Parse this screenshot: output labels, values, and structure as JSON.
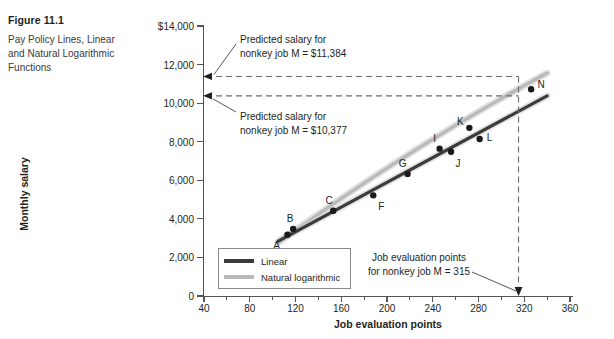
{
  "figure": {
    "number": "Figure 11.1",
    "title": "Pay Policy Lines, Linear and Natural Logarithmic Functions"
  },
  "chart_data": {
    "type": "scatter",
    "title": "Pay Policy Lines, Linear and Natural Logarithmic Functions",
    "xlabel": "Job evaluation points",
    "ylabel": "Monthly salary",
    "xlim": [
      40,
      360
    ],
    "ylim": [
      0,
      14000
    ],
    "xticks": [
      40,
      80,
      120,
      160,
      200,
      240,
      280,
      320,
      360
    ],
    "xtick_labels": [
      "40",
      "80",
      "120",
      "160",
      "200",
      "240",
      "280",
      "320",
      "360"
    ],
    "xminor_step": 20,
    "yticks": [
      0,
      2000,
      4000,
      6000,
      8000,
      10000,
      12000,
      14000
    ],
    "ytick_labels": [
      "0",
      "2,000",
      "4,000",
      "6,000",
      "8,000",
      "10,000",
      "12,000",
      "$14,000"
    ],
    "grid": false,
    "legend_position": "lower-left-inside",
    "points": [
      {
        "label": "A",
        "x": 113,
        "y": 3180,
        "label_dx": -11,
        "label_dy": 10
      },
      {
        "label": "B",
        "x": 118,
        "y": 3480,
        "label_dx": -3,
        "label_dy": -11
      },
      {
        "label": "C",
        "x": 153,
        "y": 4420,
        "label_dx": -4,
        "label_dy": -11
      },
      {
        "label": "F",
        "x": 188,
        "y": 5220,
        "label_dx": 8,
        "label_dy": 11
      },
      {
        "label": "G",
        "x": 218,
        "y": 6330,
        "label_dx": -5,
        "label_dy": -11
      },
      {
        "label": "I",
        "x": 246,
        "y": 7640,
        "label_dx": -5,
        "label_dy": -11
      },
      {
        "label": "J",
        "x": 256,
        "y": 7480,
        "label_dx": 7,
        "label_dy": 11
      },
      {
        "label": "K",
        "x": 272,
        "y": 8720,
        "label_dx": -9,
        "label_dy": -7
      },
      {
        "label": "L",
        "x": 281,
        "y": 8140,
        "label_dx": 10,
        "label_dy": -2
      },
      {
        "label": "N",
        "x": 326,
        "y": 10720,
        "label_dx": 10,
        "label_dy": -5
      }
    ],
    "series": [
      {
        "name": "Linear",
        "type": "line",
        "color": "#3b3b3b",
        "endpoints": [
          {
            "x": 105,
            "y": 2850
          },
          {
            "x": 340,
            "y": 10380
          }
        ]
      },
      {
        "name": "Natural logarithmic",
        "type": "line",
        "color": "#b9b9b9",
        "endpoints": [
          {
            "x": 105,
            "y": 2780
          },
          {
            "x": 340,
            "y": 11560
          }
        ]
      }
    ],
    "reference_lines": [
      {
        "name": "predicted-high",
        "orientation": "horizontal",
        "y": 11384,
        "style": "dashed"
      },
      {
        "name": "predicted-low",
        "orientation": "horizontal",
        "y": 10377,
        "style": "dashed"
      },
      {
        "name": "job-m-points",
        "orientation": "vertical",
        "x": 315,
        "style": "dashed"
      }
    ],
    "annotations": [
      {
        "name": "predicted-high-label",
        "text": "Predicted salary for nonkey job M = $11,384"
      },
      {
        "name": "predicted-low-label",
        "text": "Predicted salary for nonkey job M = $10,377"
      },
      {
        "name": "job-points-label",
        "text": "Job evaluation points for nonkey job M = 315"
      }
    ]
  },
  "annotations": {
    "high_line1": "Predicted salary for",
    "high_line2": "nonkey job M = $11,384",
    "low_line1": "Predicted salary for",
    "low_line2": "nonkey job M = $10,377",
    "points_line1": "Job evaluation points",
    "points_line2": "for nonkey job M = 315"
  },
  "legend": {
    "items": [
      {
        "label": "Linear",
        "color": "#3b3b3b"
      },
      {
        "label": "Natural logarithmic",
        "color": "#b9b9b9"
      }
    ]
  },
  "axes": {
    "y_title": "Monthly salary",
    "x_title": "Job evaluation points"
  }
}
